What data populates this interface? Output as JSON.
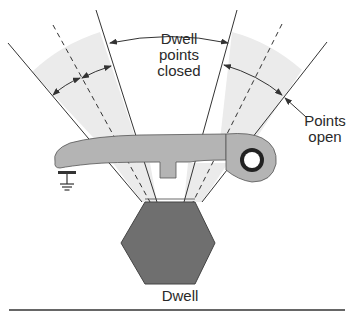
{
  "diagram": {
    "type": "breaker-points-dwell",
    "labels": {
      "center_line1": "Dwell",
      "center_line2": "points",
      "center_line3": "closed",
      "open_line1": "Points",
      "open_line2": "open",
      "bottom": "Dwell"
    },
    "components": [
      "distributor-cam",
      "breaker-point-arm",
      "pivot-bushing",
      "ground-symbol",
      "rubbing-block"
    ],
    "colors": {
      "cam_fill": "#6f6f6f",
      "arm_fill": "#b4b4b4",
      "sector_fill": "#ebebeb",
      "line": "#333333",
      "text": "#2a2a2a"
    }
  }
}
